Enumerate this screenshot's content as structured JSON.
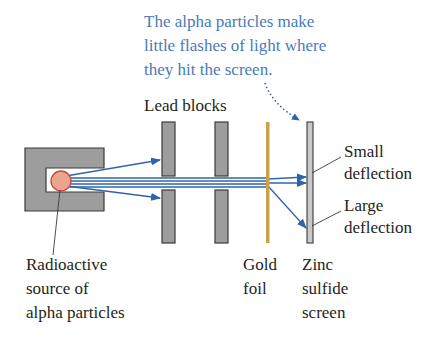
{
  "callout": {
    "lines": [
      "The alpha particles make",
      "little flashes of light where",
      "they hit the screen."
    ],
    "color": "#4a7bb7"
  },
  "labels": {
    "lead_blocks": "Lead blocks",
    "small_deflection": [
      "Small",
      "deflection"
    ],
    "large_deflection": [
      "Large",
      "deflection"
    ],
    "source": [
      "Radioactive",
      "source of",
      "alpha particles"
    ],
    "gold_foil": [
      "Gold",
      "foil"
    ],
    "screen": [
      "Zinc",
      "sulfide",
      "screen"
    ]
  },
  "colors": {
    "lead": "#9d9d9d",
    "lead_outline": "#3a3a3a",
    "source_fill": "#e9a58f",
    "source_outline": "#c9483a",
    "beam": "#2f64a8",
    "gold": "#c9a24a",
    "screen_fill": "#c9c9c9"
  },
  "icons": {
    "source": "radioactive-source-circle",
    "beam_arrows": "alpha-beam-arrows"
  }
}
